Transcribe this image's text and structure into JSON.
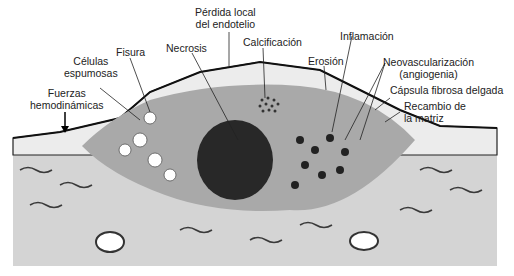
{
  "diagram": {
    "labels": {
      "perdida_endotelio_l1": "Pérdida local",
      "perdida_endotelio_l2": "del endotelio",
      "calcificacion": "Calcificación",
      "inflamacion": "Inflamación",
      "fisura": "Fisura",
      "necrosis": "Necrosis",
      "erosion": "Erosión",
      "neovascularizacion_l1": "Neovascularización",
      "neovascularizacion_l2": "(angiogenia)",
      "celulas_espumosas_l1": "Células",
      "celulas_espumosas_l2": "espumosas",
      "capsula_fibrosa": "Cápsula fibrosa delgada",
      "fuerzas_l1": "Fuerzas",
      "fuerzas_l2": "hemodinámicas",
      "recambio_l1": "Recambio de",
      "recambio_l2": "la matriz"
    },
    "colors": {
      "media": "#d4d4d4",
      "plaque": "#a9a9a9",
      "intima": "#ececec",
      "fibers": "#3a3a3a",
      "necrotic_core": "#1a1a1a",
      "lines": "#222222"
    }
  }
}
